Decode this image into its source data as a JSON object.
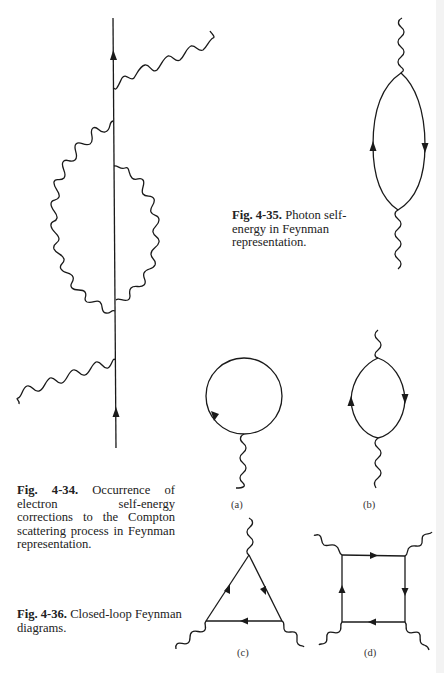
{
  "figures": [
    {
      "id": "fig-4-34",
      "label": "Fig. 4-34.",
      "text": " Occurrence of electron self-energy corrections to the Compton scattering process in Feynman representation.",
      "lines": [
        "Occurrence of elec-",
        "tron self-energy corrections to the",
        "Compton scattering process in",
        "Feynman representation."
      ]
    },
    {
      "id": "fig-4-35",
      "label": "Fig. 4-35.",
      "text": " Photon self-energy in Feynman representation.",
      "lines": [
        "Photon self-",
        "energy in Feynman repre-",
        "sentation."
      ]
    },
    {
      "id": "fig-4-36",
      "label": "Fig. 4-36.",
      "text": " Closed-loop Feynman diagrams.",
      "lines": [
        "Closed-loop Feynman",
        "diagrams."
      ]
    }
  ],
  "sublabels": {
    "a": "(a)",
    "b": "(b)",
    "c": "(c)",
    "d": "(d)"
  },
  "diagram_elements": {
    "fig_4_34": [
      "electron-line",
      "incoming-photon",
      "outgoing-photon",
      "self-energy-loop-left",
      "self-energy-loop-right"
    ],
    "fig_4_35": [
      "top-photon",
      "fermion-loop",
      "bottom-photon"
    ],
    "fig_4_36_a": [
      "tadpole-loop",
      "photon"
    ],
    "fig_4_36_b": [
      "fermion-loop",
      "two-photons"
    ],
    "fig_4_36_c": [
      "triangle-loop",
      "three-photons"
    ],
    "fig_4_36_d": [
      "box-loop",
      "four-photons"
    ]
  }
}
